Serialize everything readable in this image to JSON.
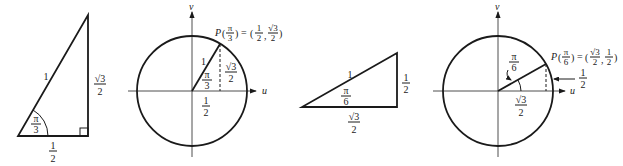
{
  "figure": {
    "panels": [
      {
        "id": "triangle-pi-3",
        "angle_label": {
          "num": "π",
          "den": "3"
        },
        "hypotenuse_label": "1",
        "base_label": {
          "num": "1",
          "den": "2"
        },
        "height_label": {
          "num": "√3",
          "den": "2"
        },
        "right_angle_marker": true
      },
      {
        "id": "circle-pi-3",
        "v_axis_label": "v",
        "u_axis_label": "u",
        "point_label": "P(π/3) = (1/2, √3/2)",
        "point_label_parts": {
          "P": "P",
          "arg_num": "π",
          "arg_den": "3",
          "eq": "=",
          "x_num": "1",
          "x_den": "2",
          "y_num": "√3",
          "y_den": "2"
        },
        "radius_label": "1",
        "angle_label": {
          "num": "π",
          "den": "3"
        },
        "height_label": {
          "num": "√3",
          "den": "2"
        },
        "base_label": {
          "num": "1",
          "den": "2"
        }
      },
      {
        "id": "triangle-pi-6",
        "angle_label": {
          "num": "π",
          "den": "6"
        },
        "hypotenuse_label": "1",
        "base_label": {
          "num": "√3",
          "den": "2"
        },
        "height_label": {
          "num": "1",
          "den": "2"
        }
      },
      {
        "id": "circle-pi-6",
        "v_axis_label": "v",
        "u_axis_label": "u",
        "point_label": "P(π/6) = (√3/2, 1/2)",
        "point_label_parts": {
          "P": "P",
          "arg_num": "π",
          "arg_den": "6",
          "eq": "=",
          "x_num": "√3",
          "x_den": "2",
          "y_num": "1",
          "y_den": "2"
        },
        "angle_label": {
          "num": "π",
          "den": "6"
        },
        "height_label": {
          "num": "1",
          "den": "2"
        },
        "base_label": {
          "num": "√3",
          "den": "2"
        }
      }
    ]
  }
}
